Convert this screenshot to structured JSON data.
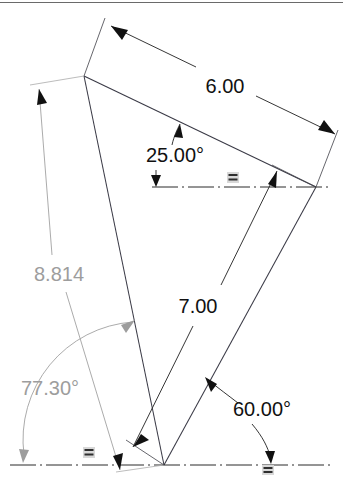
{
  "canvas": {
    "width": 343,
    "height": 483,
    "background": "#ffffff"
  },
  "colors": {
    "geometry": "#3a3a46",
    "driving_dimension": "#111111",
    "driven_dimension": "#9d9d9d",
    "datum_line": "#2b2b2b",
    "constraint_glyph": "#2f2f2f"
  },
  "drawing": {
    "type": "cad-sketch-triangle-with-dimensions",
    "title": "Dimensioned triangle sketch"
  },
  "dimensions": [
    {
      "id": "len-6",
      "label": "6.00",
      "kind": "linear",
      "driven": false,
      "color": "#111111",
      "text_x": 225,
      "text_y": 88
    },
    {
      "id": "ang-25",
      "label": "25.00°",
      "kind": "angular",
      "driven": false,
      "color": "#111111",
      "text_x": 175,
      "text_y": 157
    },
    {
      "id": "len-8814",
      "label": "8.814",
      "kind": "linear-reference",
      "driven": true,
      "color": "#9d9d9d",
      "text_x": 59,
      "text_y": 276
    },
    {
      "id": "len-7",
      "label": "7.00",
      "kind": "linear",
      "driven": false,
      "color": "#111111",
      "text_x": 198,
      "text_y": 308
    },
    {
      "id": "ang-7730",
      "label": "77.30°",
      "kind": "angular-reference",
      "driven": true,
      "color": "#9d9d9d",
      "text_x": 50,
      "text_y": 390
    },
    {
      "id": "ang-60",
      "label": "60.00°",
      "kind": "angular",
      "driven": false,
      "color": "#111111",
      "text_x": 262,
      "text_y": 411
    }
  ],
  "constraints": [
    {
      "id": "horizontal-1",
      "glyph": "horizontal-constraint-icon",
      "x": 233,
      "y": 178
    },
    {
      "id": "horizontal-2",
      "glyph": "horizontal-constraint-icon",
      "x": 89,
      "y": 453
    },
    {
      "id": "horizontal-3",
      "glyph": "horizontal-constraint-icon",
      "x": 268,
      "y": 470
    }
  ],
  "geometry": {
    "vertices": [
      {
        "name": "top-left-vertex",
        "x": 84,
        "y": 76
      },
      {
        "name": "right-vertex",
        "x": 316,
        "y": 187
      },
      {
        "name": "bottom-vertex",
        "x": 164,
        "y": 465
      }
    ]
  }
}
